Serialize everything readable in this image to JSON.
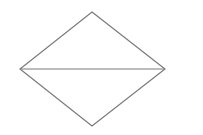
{
  "diagram": {
    "shape": "rhombus-with-horizontal-diagonal",
    "stroke_color": "#7a7a7a",
    "background": "#ffffff",
    "vertices": {
      "top": [
        92,
        12
      ],
      "right": [
        165,
        69
      ],
      "bottom": [
        92,
        126
      ],
      "left": [
        20,
        69
      ]
    }
  }
}
